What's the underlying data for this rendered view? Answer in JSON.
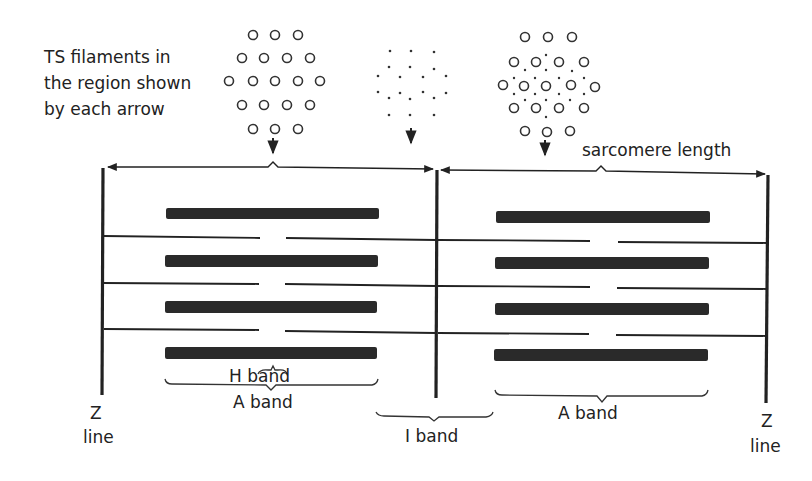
{
  "diagram": {
    "caption_lines": [
      "TS filaments in",
      "the region shown",
      "by each arrow"
    ],
    "labels": {
      "sarcomere_length": "sarcomere length",
      "h_band": "H band",
      "a_band_left": "A band",
      "a_band_right": "A band",
      "i_band": "I band",
      "z_line_left_top": "Z",
      "z_line_left_bottom": "line",
      "z_line_right_top": "Z",
      "z_line_right_bottom": "line"
    },
    "cross_sections": [
      {
        "name": "thick-filaments-only",
        "region": "H band",
        "pattern": "hexagonal circles (3-4-5-4-3)"
      },
      {
        "name": "thin-filaments-only",
        "region": "I band",
        "pattern": "dots"
      },
      {
        "name": "thick-and-thin-overlap",
        "region": "A band overlap",
        "pattern": "circles with surrounding dots"
      }
    ],
    "colors": {
      "ink": "#222222",
      "thick_filament": "#2a2a2a",
      "background": "#ffffff"
    }
  }
}
